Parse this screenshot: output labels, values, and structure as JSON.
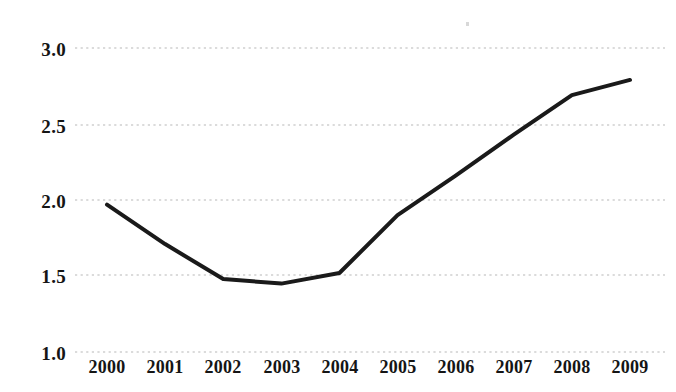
{
  "chart_data": {
    "type": "line",
    "title": "",
    "subtitle": "",
    "xlabel": "",
    "ylabel": "",
    "categories": [
      "2000",
      "2001",
      "2002",
      "2003",
      "2004",
      "2005",
      "2006",
      "2007",
      "2008",
      "2009"
    ],
    "x": [
      2000,
      2001,
      2002,
      2003,
      2004,
      2005,
      2006,
      2007,
      2008,
      2009
    ],
    "values": [
      1.97,
      1.71,
      1.48,
      1.45,
      1.52,
      1.9,
      2.16,
      2.43,
      2.69,
      2.79
    ],
    "series": [
      {
        "name": "",
        "values": [
          1.97,
          1.71,
          1.48,
          1.45,
          1.52,
          1.9,
          2.16,
          2.43,
          2.69,
          2.79
        ]
      }
    ],
    "ylim": [
      1.0,
      3.0
    ],
    "y_ticks": [
      1.0,
      1.5,
      2.0,
      2.5,
      3.0
    ],
    "y_tick_labels": [
      "1.0",
      "1.5",
      "2.0",
      "2.5",
      "3.0"
    ],
    "x_tick_labels": [
      "2000",
      "2001",
      "2002",
      "2003",
      "2004",
      "2005",
      "2006",
      "2007",
      "2008",
      "2009"
    ],
    "grid": {
      "horizontal": true,
      "vertical": false,
      "style": "dotted",
      "color": "#cfcfcf"
    },
    "legend": {
      "visible": false,
      "position": "none",
      "entries": []
    },
    "annotations": [],
    "line_color": "#1a1a1a",
    "line_width": 4,
    "markers": false,
    "background_color": "#ffffff"
  },
  "axis": {
    "y_labels": [
      "3.0",
      "2.5",
      "2.0",
      "1.5",
      "1.0"
    ],
    "x_labels": [
      "2000",
      "2001",
      "2002",
      "2003",
      "2004",
      "2005",
      "2006",
      "2007",
      "2008",
      "2009"
    ]
  }
}
